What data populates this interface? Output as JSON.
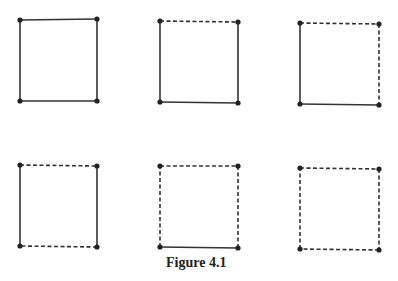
{
  "caption": "Figure 4.1",
  "colors": {
    "line": "#333333",
    "node": "#222222",
    "background": "#ffffff"
  },
  "squares": [
    {
      "id": 1,
      "corners": [
        [
          20,
          20
        ],
        [
          97,
          19
        ],
        [
          97,
          101
        ],
        [
          20,
          101
        ]
      ],
      "edges": {
        "top": "solid",
        "right": "solid",
        "bottom": "solid",
        "left": "solid"
      }
    },
    {
      "id": 2,
      "corners": [
        [
          160,
          21
        ],
        [
          238,
          22
        ],
        [
          238,
          103
        ],
        [
          160,
          102
        ]
      ],
      "edges": {
        "top": "dashed",
        "right": "solid",
        "bottom": "solid",
        "left": "solid"
      }
    },
    {
      "id": 3,
      "corners": [
        [
          300,
          23
        ],
        [
          379,
          24
        ],
        [
          379,
          105
        ],
        [
          300,
          104
        ]
      ],
      "edges": {
        "top": "dashed",
        "right": "dashed",
        "bottom": "solid",
        "left": "solid"
      }
    },
    {
      "id": 4,
      "corners": [
        [
          20,
          165
        ],
        [
          97,
          166
        ],
        [
          97,
          247
        ],
        [
          20,
          246
        ]
      ],
      "edges": {
        "top": "dashed",
        "right": "solid",
        "bottom": "dashed",
        "left": "solid"
      }
    },
    {
      "id": 5,
      "corners": [
        [
          160,
          166
        ],
        [
          238,
          166
        ],
        [
          238,
          248
        ],
        [
          160,
          247
        ]
      ],
      "edges": {
        "top": "dashed",
        "right": "dashed",
        "bottom": "solid",
        "left": "dashed"
      }
    },
    {
      "id": 6,
      "corners": [
        [
          300,
          168
        ],
        [
          379,
          169
        ],
        [
          379,
          250
        ],
        [
          300,
          249
        ]
      ],
      "edges": {
        "top": "dashed",
        "right": "dashed",
        "bottom": "dashed",
        "left": "dashed"
      }
    }
  ]
}
